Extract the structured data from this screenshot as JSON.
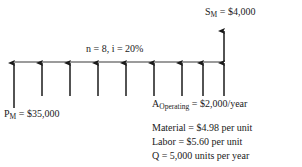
{
  "diagram": {
    "type": "cash-flow-diagram",
    "colors": {
      "stroke": "#1a1a1a",
      "timeline": "#6b6b6b",
      "background": "#ffffff",
      "text": "#1a1a1a"
    },
    "timeline": {
      "label": "n = 8, i = 20%",
      "periods": 8,
      "interest_rate": "20%",
      "y": 62,
      "x_start": 14,
      "x_end": 224,
      "spacing": 28
    },
    "labels": {
      "salvage": {
        "symbol": "S",
        "subscript": "M",
        "equals": " = ",
        "value": "$4,000",
        "full_text": "S_M = $4,000"
      },
      "initial_cost": {
        "symbol": "P",
        "subscript": "M",
        "equals": " = ",
        "value": "$35,000",
        "full_text": "P_M = $35,000"
      },
      "operating": {
        "symbol": "A",
        "subscript": "Operating",
        "equals": " = ",
        "value": "$2,000/year",
        "full_text": "A_Operating = $2,000/year"
      }
    },
    "notes": [
      "Material = $4.98 per unit",
      "Labor = $5.60 per unit",
      "Q = 5,000 units per year"
    ],
    "arrows": {
      "up_recurring": [
        {
          "x": 14,
          "top": 62,
          "bottom": 108
        },
        {
          "x": 42,
          "top": 62,
          "bottom": 96
        },
        {
          "x": 70,
          "top": 62,
          "bottom": 96
        },
        {
          "x": 98,
          "top": 62,
          "bottom": 96
        },
        {
          "x": 126,
          "top": 62,
          "bottom": 96
        },
        {
          "x": 154,
          "top": 62,
          "bottom": 96
        },
        {
          "x": 182,
          "top": 62,
          "bottom": 96
        },
        {
          "x": 203,
          "top": 62,
          "bottom": 96
        },
        {
          "x": 224,
          "top": 62,
          "bottom": 96
        }
      ],
      "up_salvage": {
        "x": 224,
        "top": 30,
        "bottom": 62
      }
    }
  }
}
